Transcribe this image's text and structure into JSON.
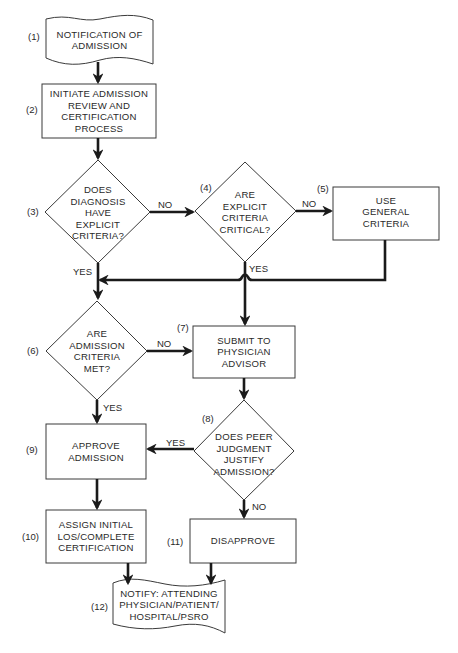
{
  "diagram": {
    "type": "flowchart",
    "nodes": [
      {
        "id": "1",
        "step": "(1)",
        "shape": "document",
        "text": "NOTIFICATION OF\nADMISSION"
      },
      {
        "id": "2",
        "step": "(2)",
        "shape": "process",
        "text": "INITIATE ADMISSION\nREVIEW AND\nCERTIFICATION\nPROCESS"
      },
      {
        "id": "3",
        "step": "(3)",
        "shape": "decision",
        "text": "DOES\nDIAGNOSIS\nHAVE\nEXPLICIT\nCRITERIA?"
      },
      {
        "id": "4",
        "step": "(4)",
        "shape": "decision",
        "text": "ARE\nEXPLICIT\nCRITERIA\nCRITICAL?"
      },
      {
        "id": "5",
        "step": "(5)",
        "shape": "process",
        "text": "USE\nGENERAL\nCRITERIA"
      },
      {
        "id": "6",
        "step": "(6)",
        "shape": "decision",
        "text": "ARE\nADMISSION\nCRITERIA\nMET?"
      },
      {
        "id": "7",
        "step": "(7)",
        "shape": "process",
        "text": "SUBMIT TO\nPHYSICIAN\nADVISOR"
      },
      {
        "id": "8",
        "step": "(8)",
        "shape": "decision",
        "text": "DOES PEER\nJUDGMENT\nJUSTIFY\nADMISSION?"
      },
      {
        "id": "9",
        "step": "(9)",
        "shape": "process",
        "text": "APPROVE\nADMISSION"
      },
      {
        "id": "10",
        "step": "(10)",
        "shape": "process",
        "text": "ASSIGN INITIAL\nLOS/COMPLETE\nCERTIFICATION"
      },
      {
        "id": "11",
        "step": "(11)",
        "shape": "process",
        "text": "DISAPPROVE"
      },
      {
        "id": "12",
        "step": "(12)",
        "shape": "document",
        "text": "NOTIFY: ATTENDING\nPHYSICIAN/PATIENT/\nHOSPITAL/PSRO"
      }
    ],
    "edges": [
      {
        "from": "1",
        "to": "2",
        "label": ""
      },
      {
        "from": "2",
        "to": "3",
        "label": ""
      },
      {
        "from": "3",
        "to": "4",
        "label": "NO"
      },
      {
        "from": "4",
        "to": "5",
        "label": "NO"
      },
      {
        "from": "3",
        "to": "6",
        "label": "YES"
      },
      {
        "from": "5",
        "to": "6",
        "label": ""
      },
      {
        "from": "4",
        "to": "7",
        "label": "YES"
      },
      {
        "from": "6",
        "to": "7",
        "label": "NO"
      },
      {
        "from": "6",
        "to": "9",
        "label": "YES"
      },
      {
        "from": "7",
        "to": "8",
        "label": ""
      },
      {
        "from": "8",
        "to": "9",
        "label": "YES"
      },
      {
        "from": "8",
        "to": "11",
        "label": "NO"
      },
      {
        "from": "9",
        "to": "10",
        "label": ""
      },
      {
        "from": "10",
        "to": "12",
        "label": ""
      },
      {
        "from": "11",
        "to": "12",
        "label": ""
      }
    ],
    "edge_labels": {
      "no_3_4": "NO",
      "no_4_5": "NO",
      "yes_3_6": "YES",
      "yes_4_7": "YES",
      "no_6_7": "NO",
      "yes_6_9": "YES",
      "yes_8_9": "YES",
      "no_8_11": "NO"
    }
  },
  "colors": {
    "line": "#1a1a1a",
    "shape_stroke": "#3a3a3a",
    "text": "#2a2a2a",
    "background": "#ffffff"
  }
}
